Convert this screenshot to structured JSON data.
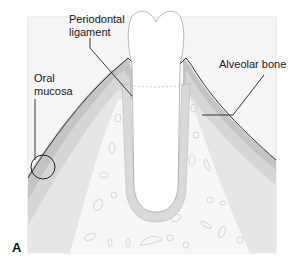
{
  "figure": {
    "panel_letter": "A",
    "labels": {
      "periodontal_ligament_line1": "Periodontal",
      "periodontal_ligament_line2": "ligament",
      "oral_mucosa_line1": "Oral",
      "oral_mucosa_line2": "mucosa",
      "alveolar_bone": "Alveolar bone"
    },
    "colors": {
      "background": "#ffffff",
      "frame_fill": "#f4f4f4",
      "mucosa_dark": "#bdbdbd",
      "mucosa_mid": "#d2d2d2",
      "connective_light": "#e6e6e6",
      "bone_fill": "#f7f7f7",
      "tooth_fill": "#ffffff",
      "ligament_fill": "#d9d9d9",
      "outline": "#333333",
      "leader_line": "#222222"
    }
  }
}
